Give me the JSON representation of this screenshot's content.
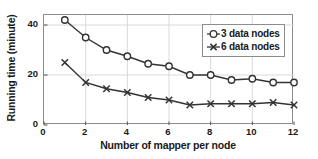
{
  "chart_data": {
    "type": "line",
    "title": "",
    "xlabel": "Number of mapper per node",
    "ylabel": "Running time (minute)",
    "x": [
      1,
      2,
      3,
      4,
      5,
      6,
      7,
      8,
      9,
      10,
      11,
      12
    ],
    "xlim": [
      0,
      12
    ],
    "ylim": [
      0,
      44
    ],
    "xticks": [
      "0",
      "2",
      "4",
      "6",
      "8",
      "10",
      "12"
    ],
    "xtick_values": [
      0,
      2,
      4,
      6,
      8,
      10,
      12
    ],
    "yticks": [
      "0",
      "20",
      "40"
    ],
    "ytick_values": [
      0,
      20,
      40
    ],
    "grid": true,
    "grid_color": "#d9d9d9",
    "legend_position": "upper right",
    "line_color": "#333333",
    "series": [
      {
        "name": "3 data nodes",
        "marker": "circle",
        "values": [
          42,
          35,
          30,
          27.5,
          24.5,
          23.5,
          20,
          20,
          18,
          18.5,
          17,
          17
        ]
      },
      {
        "name": "6 data nodes",
        "marker": "x",
        "values": [
          25,
          17,
          14.5,
          13,
          11,
          10,
          8,
          8.5,
          8.5,
          8.5,
          9,
          8
        ]
      }
    ]
  },
  "legend": {
    "items": [
      {
        "label": "3 data nodes",
        "marker": "circle-marker"
      },
      {
        "label": "6 data nodes",
        "marker": "x-marker"
      }
    ]
  }
}
